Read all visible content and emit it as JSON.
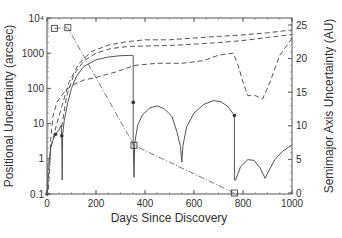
{
  "chart_data": {
    "type": "line",
    "title": "",
    "xlabel": "Days Since Discovery",
    "ylabel_left": "Positional Uncertainty (arcsec)",
    "ylabel_right": "Semimajor Axis Uncertainty (AU)",
    "xlim": [
      0,
      1000
    ],
    "ylim_left": [
      0.1,
      10000
    ],
    "ylim_left_scale": "log",
    "ylim_right": [
      0,
      26
    ],
    "x_ticks": [
      0,
      200,
      400,
      600,
      800,
      1000
    ],
    "x_tick_labels": [
      "0",
      "200",
      "400",
      "600",
      "800",
      "1000"
    ],
    "y_left_ticks": [
      0.1,
      1,
      10,
      100,
      1000,
      10000
    ],
    "y_left_tick_labels": [
      "0.1",
      "1",
      "10",
      "100",
      "1000",
      "10⁴"
    ],
    "y_right_ticks": [
      0,
      5,
      10,
      15,
      20,
      25
    ],
    "y_right_tick_labels": [
      "0",
      "5",
      "10",
      "15",
      "20",
      "25"
    ],
    "grid": false,
    "legend": null,
    "series": [
      {
        "name": "Positional uncertainty (solid)",
        "axis": "left",
        "style": "solid",
        "points": [
          [
            0,
            0.1
          ],
          [
            2,
            0.1
          ],
          [
            4,
            0.7
          ],
          [
            8,
            0.8
          ],
          [
            15,
            2
          ],
          [
            25,
            3.5
          ],
          [
            35,
            5
          ],
          [
            50,
            7
          ],
          [
            58,
            9
          ],
          [
            60,
            4.5
          ],
          [
            62,
            0.25
          ],
          [
            64,
            5
          ],
          [
            70,
            12
          ],
          [
            85,
            40
          ],
          [
            100,
            100
          ],
          [
            120,
            220
          ],
          [
            150,
            420
          ],
          [
            200,
            650
          ],
          [
            250,
            780
          ],
          [
            300,
            850
          ],
          [
            350,
            870
          ],
          [
            352,
            870
          ],
          [
            352,
            2.8
          ],
          [
            355,
            0.3
          ],
          [
            358,
            2.8
          ],
          [
            370,
            9
          ],
          [
            390,
            18
          ],
          [
            420,
            28
          ],
          [
            450,
            32
          ],
          [
            480,
            26
          ],
          [
            510,
            16
          ],
          [
            530,
            6
          ],
          [
            545,
            2.2
          ],
          [
            550,
            0.8
          ],
          [
            555,
            2.4
          ],
          [
            570,
            8
          ],
          [
            600,
            20
          ],
          [
            640,
            35
          ],
          [
            680,
            45
          ],
          [
            710,
            42
          ],
          [
            740,
            30
          ],
          [
            762,
            18
          ],
          [
            765,
            17
          ],
          [
            765,
            0.25
          ],
          [
            770,
            0.25
          ],
          [
            790,
            0.6
          ],
          [
            820,
            0.95
          ],
          [
            845,
            0.9
          ],
          [
            870,
            0.55
          ],
          [
            890,
            0.28
          ],
          [
            905,
            0.45
          ],
          [
            930,
            0.95
          ],
          [
            960,
            1.6
          ],
          [
            1000,
            2.5
          ]
        ]
      },
      {
        "name": "Positional uncertainty (dashed 1)",
        "axis": "left",
        "style": "dashed",
        "points": [
          [
            0,
            0.1
          ],
          [
            15,
            2
          ],
          [
            40,
            10
          ],
          [
            60,
            30
          ],
          [
            90,
            150
          ],
          [
            130,
            500
          ],
          [
            180,
            1100
          ],
          [
            250,
            1700
          ],
          [
            320,
            2100
          ],
          [
            400,
            2400
          ],
          [
            500,
            2400
          ],
          [
            600,
            2700
          ],
          [
            700,
            3000
          ],
          [
            800,
            3300
          ],
          [
            900,
            3800
          ],
          [
            1000,
            4600
          ]
        ]
      },
      {
        "name": "Positional uncertainty (dashed 2)",
        "axis": "left",
        "style": "dashed",
        "points": [
          [
            60,
            8
          ],
          [
            80,
            60
          ],
          [
            110,
            250
          ],
          [
            150,
            600
          ],
          [
            200,
            1000
          ],
          [
            260,
            1350
          ],
          [
            330,
            1550
          ],
          [
            400,
            1600
          ],
          [
            500,
            1650
          ],
          [
            600,
            1800
          ],
          [
            700,
            2000
          ],
          [
            800,
            2300
          ],
          [
            900,
            2800
          ],
          [
            1000,
            3400
          ]
        ]
      },
      {
        "name": "Semimajor axis uncertainty (dashed)",
        "axis": "right",
        "style": "dashed",
        "points": [
          [
            5,
            0.5
          ],
          [
            10,
            3
          ],
          [
            15,
            8
          ],
          [
            25,
            11.5
          ],
          [
            40,
            13.5
          ],
          [
            70,
            15
          ],
          [
            100,
            16
          ],
          [
            150,
            16.8
          ],
          [
            200,
            17.2
          ],
          [
            280,
            18
          ],
          [
            360,
            19
          ],
          [
            450,
            19.3
          ],
          [
            550,
            19.3
          ],
          [
            640,
            19.7
          ],
          [
            700,
            20.5
          ],
          [
            760,
            20.8
          ],
          [
            780,
            19
          ],
          [
            800,
            16.5
          ],
          [
            820,
            14.5
          ],
          [
            850,
            14.5
          ],
          [
            880,
            14
          ],
          [
            910,
            16.5
          ],
          [
            950,
            20.5
          ],
          [
            1000,
            23
          ]
        ]
      },
      {
        "name": "Observation markers (squares)",
        "axis": "right",
        "style": "dash-dot",
        "points": [
          [
            30,
            24.5
          ],
          [
            85,
            24.6
          ],
          [
            355,
            7.1
          ],
          [
            765,
            0
          ]
        ]
      }
    ],
    "point_markers": [
      {
        "x": 0,
        "y": 0.1,
        "axis": "left"
      },
      {
        "x": 35,
        "y": 5,
        "axis": "left"
      },
      {
        "x": 60,
        "y": 4.5,
        "axis": "left"
      },
      {
        "x": 352,
        "y": 40,
        "axis": "left"
      },
      {
        "x": 765,
        "y": 17,
        "axis": "left"
      }
    ]
  },
  "axes": {
    "xlabel": "Days Since Discovery",
    "ylabel_left": "Positional Uncertainty (arcsec)",
    "ylabel_right": "Semimajor Axis Uncertainty (AU)"
  }
}
